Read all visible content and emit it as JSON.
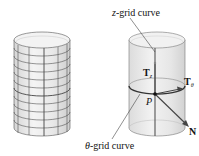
{
  "figure": {
    "left_panel": {
      "description": "cylinder with grid",
      "rings": 11,
      "vertical_lines": 5
    },
    "right_panel": {
      "labels": {
        "z_grid_prefix": "z",
        "z_grid_suffix": "-grid curve",
        "theta_grid_prefix": "θ",
        "theta_grid_suffix": "-grid curve",
        "Tz_main": "T",
        "Tz_sub": "z",
        "Ttheta_main": "T",
        "Ttheta_sub": "θ",
        "P": "P",
        "N": "N"
      }
    },
    "colors": {
      "surface_fill": "#e9e9e9",
      "grid_line": "#444444",
      "highlight_curve": "#333333",
      "text": "#111111"
    }
  }
}
